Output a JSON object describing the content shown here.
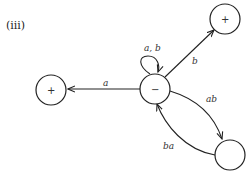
{
  "diagram": {
    "title": "(iii)",
    "nodes": [
      {
        "id": "center",
        "symbol": "−"
      },
      {
        "id": "left",
        "symbol": "+"
      },
      {
        "id": "top-right",
        "symbol": "+"
      },
      {
        "id": "bottom-right",
        "symbol": ""
      }
    ],
    "edges": [
      {
        "from": "center",
        "to": "center",
        "label": "a, b"
      },
      {
        "from": "center",
        "to": "left",
        "label": "a"
      },
      {
        "from": "center",
        "to": "top-right",
        "label": "b"
      },
      {
        "from": "center",
        "to": "bottom-right",
        "label": "ab"
      },
      {
        "from": "bottom-right",
        "to": "center",
        "label": "ba"
      }
    ]
  }
}
